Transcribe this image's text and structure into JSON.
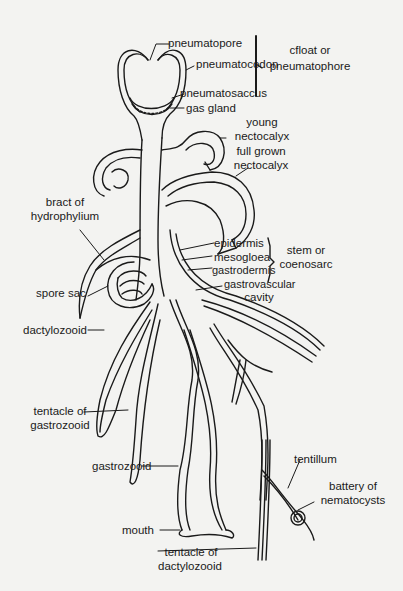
{
  "figure": {
    "labels": {
      "pneumatopore": "pneumatopore",
      "pneumatocodon": "pneumatocodon",
      "pneumatosaccus": "pneumatosaccus",
      "gas_gland": "gas  gland",
      "float_group_line1": "cfloat or",
      "float_group_line2": "pneumatophore",
      "young_nectocalyx_line1": "young",
      "young_nectocalyx_line2": "nectocalyx",
      "full_grown_nectocalyx_line1": "full grown",
      "full_grown_nectocalyx_line2": "nectocalyx",
      "bract_line1": "bract of",
      "bract_line2": "hydrophylium",
      "epidermis": "epidermis",
      "mesogloea": "mesogloea",
      "gastrodermis": "gastrodermis",
      "stem_group_line1": "stem or",
      "stem_group_line2": "coenosarc",
      "spore_sac": "spore sac",
      "gastrovascular_line1": "gastrovascular",
      "gastrovascular_line2": "cavity",
      "dactylozooid": "dactylozooid",
      "tentacle_gastrozooid_line1": "tentacle of",
      "tentacle_gastrozooid_line2": "gastrozooid",
      "gastrozooid": "gastrozooid",
      "tentillum": "tentillum",
      "battery_line1": "battery of",
      "battery_line2": "nematocysts",
      "mouth": "mouth",
      "tentacle_dactylozooid_line1": "tentacle of",
      "tentacle_dactylozooid_line2": "dactylozooid"
    },
    "colors": {
      "background": "#f3f3f1",
      "ink": "#1a1a1a"
    }
  }
}
